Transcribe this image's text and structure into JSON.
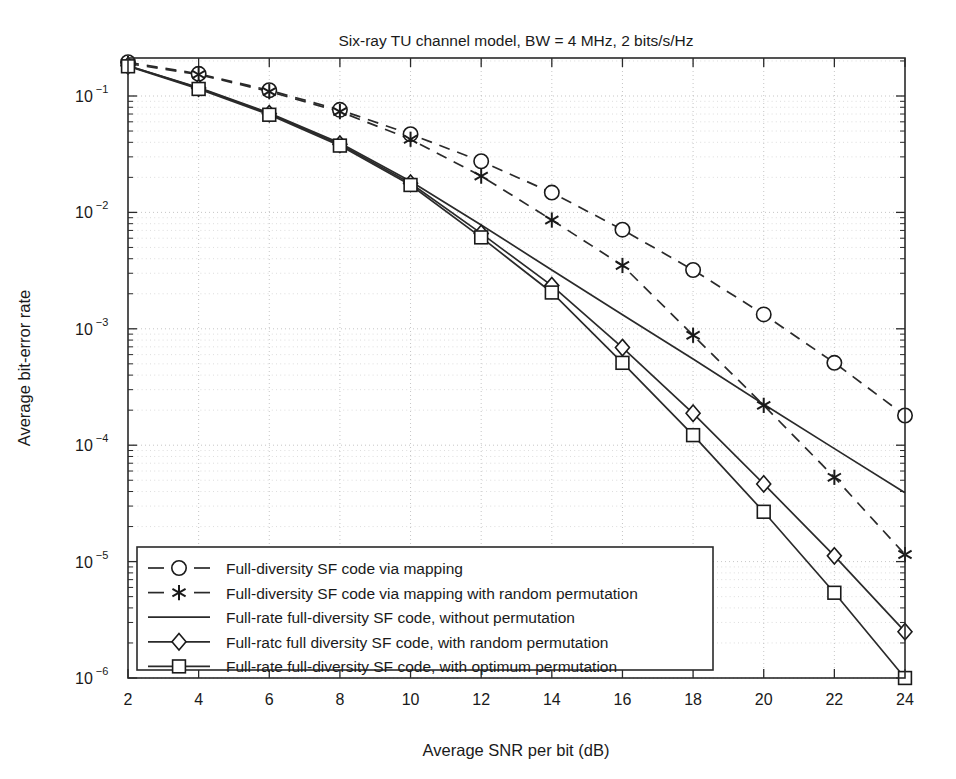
{
  "chart_data": {
    "type": "line",
    "title": "Six-ray TU channel model, BW = 4 MHz, 2 bits/s/Hz",
    "xlabel": "Average SNR per bit (dB)",
    "ylabel": "Average bit-error rate",
    "xlim": [
      2,
      24
    ],
    "ylim": [
      1e-06,
      0.22
    ],
    "yscale": "log",
    "xticks": [
      2,
      4,
      6,
      8,
      10,
      12,
      14,
      16,
      18,
      20,
      22,
      24
    ],
    "xticklabels": [
      "2",
      "4",
      "6",
      "8",
      "10",
      "12",
      "14",
      "16",
      "18",
      "20",
      "22",
      "24"
    ],
    "yticks": [
      0.1,
      0.01,
      0.001,
      0.0001,
      1e-05,
      1e-06
    ],
    "yticklabels": [
      "10-1",
      "10-2",
      "10-3",
      "10-4",
      "10-5",
      "10-6"
    ],
    "ytick_bases": [
      "10",
      "10",
      "10",
      "10",
      "10",
      "10"
    ],
    "ytick_exponents": [
      "−1",
      "−2",
      "−3",
      "−4",
      "−5",
      "−6"
    ],
    "grid": true,
    "grid_style": "dotted",
    "legend_position": "lower left",
    "x": [
      2,
      4,
      6,
      8,
      10,
      12,
      14,
      16,
      18,
      20,
      22,
      24
    ],
    "series": [
      {
        "name": "Full-diversity SF code via mapping",
        "marker": "circle",
        "linestyle": "dashed",
        "values": [
          0.195,
          0.155,
          0.112,
          0.076,
          0.047,
          0.0275,
          0.0148,
          0.0071,
          0.0032,
          0.00133,
          0.00051,
          0.00018
        ]
      },
      {
        "name": "Full-diversity SF code via mapping with random permutation",
        "marker": "star",
        "linestyle": "dashed",
        "values": [
          0.19,
          0.153,
          0.109,
          0.0735,
          0.0425,
          0.0205,
          0.0086,
          0.0035,
          0.00088,
          0.00022,
          5.3e-05,
          1.15e-05
        ]
      },
      {
        "name": "Full-rate full-diversity SF code, without permutation",
        "marker": "none",
        "linestyle": "solid",
        "values": [
          0.182,
          0.118,
          0.0715,
          0.0395,
          0.0185,
          0.0078,
          0.0032,
          0.00132,
          0.00055,
          0.000225,
          9.35e-05,
          3.9e-05
        ]
      },
      {
        "name": "Full-rate full-diversity SF code, with random permutation",
        "marker": "diamond",
        "linestyle": "solid",
        "values": [
          0.182,
          0.117,
          0.0705,
          0.0385,
          0.0178,
          0.0066,
          0.00235,
          0.00069,
          0.000188,
          4.65e-05,
          1.12e-05,
          2.5e-06
        ]
      },
      {
        "name": "Full-rate full-diversity SF code, with optimum permutation",
        "marker": "square",
        "linestyle": "solid",
        "values": [
          0.18,
          0.115,
          0.069,
          0.0375,
          0.0172,
          0.0061,
          0.00205,
          0.00051,
          0.000122,
          2.68e-05,
          5.4e-06,
          1e-06
        ]
      }
    ],
    "legend_entries": [
      "Full-diversity SF code via mapping",
      "Full-diversity SF code via mapping with random permutation",
      "Full-rate full-diversity SF code, without permutation",
      "Full-ratc full diversity SF code, with random permutation",
      "Full-rate full-diversity SF code, with optimum permutation"
    ]
  },
  "colors": {
    "line": "#2a2a2a",
    "grid": "#b8b8b8",
    "background": "#ffffff",
    "text": "#1a1a1a"
  }
}
